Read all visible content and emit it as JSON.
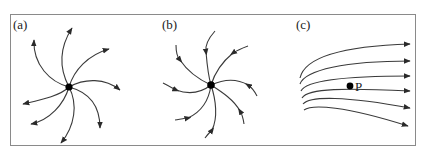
{
  "figure": {
    "panels": [
      {
        "id": "a",
        "label": "(a)",
        "description": "source: curves spiral outward from central point, arrows at outer ends"
      },
      {
        "id": "b",
        "label": "(b)",
        "description": "sink: curves spiral inward toward central point, arrows midway pointing inward"
      },
      {
        "id": "c",
        "label": "(c)",
        "description": "six roughly parallel curved streamlines flowing left to right, with marked point",
        "point_label": "P"
      }
    ],
    "colors": {
      "frame": "#8a8a8a",
      "curve": "#3a3a3a",
      "dot": "#000000"
    }
  }
}
